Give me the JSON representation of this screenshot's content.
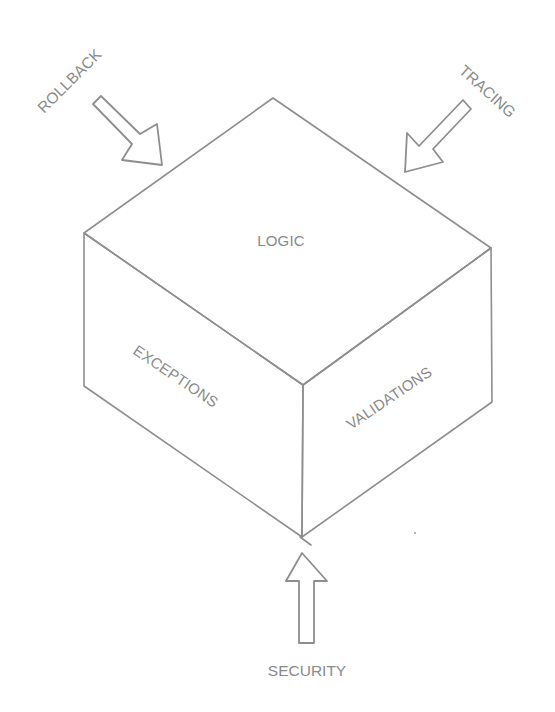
{
  "diagram": {
    "type": "isometric-cube-sketch",
    "cube": {
      "faces": {
        "top": {
          "label": "LOGIC"
        },
        "left": {
          "label": "EXCEPTIONS"
        },
        "right": {
          "label": "VALIDATIONS"
        }
      }
    },
    "inputs": [
      {
        "id": "rollback",
        "label": "ROLLBACK",
        "direction": "from top-left toward cube"
      },
      {
        "id": "tracing",
        "label": "TRACING",
        "direction": "from top-right toward cube"
      },
      {
        "id": "security",
        "label": "SECURITY",
        "direction": "from bottom up toward cube"
      }
    ],
    "colors": {
      "stroke": "#8e8e8e",
      "text": "#8a8a8a",
      "background": "#ffffff"
    }
  }
}
